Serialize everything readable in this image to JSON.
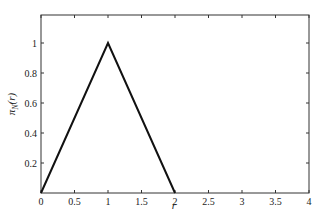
{
  "chart_data": {
    "type": "line",
    "title": "",
    "xlabel": "r",
    "ylabel": "π_N(r)",
    "xlim": [
      0,
      4
    ],
    "ylim": [
      0,
      1.2
    ],
    "xticks": [
      0,
      0.5,
      1,
      1.5,
      2,
      2.5,
      3,
      3.5,
      4
    ],
    "xtick_labels": [
      "0",
      "0.5",
      "1",
      "1.5",
      "2",
      "2.5",
      "3",
      "3.5",
      "4"
    ],
    "yticks": [
      0.2,
      0.4,
      0.6,
      0.8,
      1
    ],
    "ytick_labels": [
      "0.2",
      "0.4",
      "0.6",
      "0.8",
      "1"
    ],
    "grid": false,
    "legend": null,
    "series": [
      {
        "name": "π_N(r)",
        "x": [
          0,
          1,
          2
        ],
        "y": [
          0,
          1,
          0
        ],
        "color": "#111111"
      }
    ]
  }
}
